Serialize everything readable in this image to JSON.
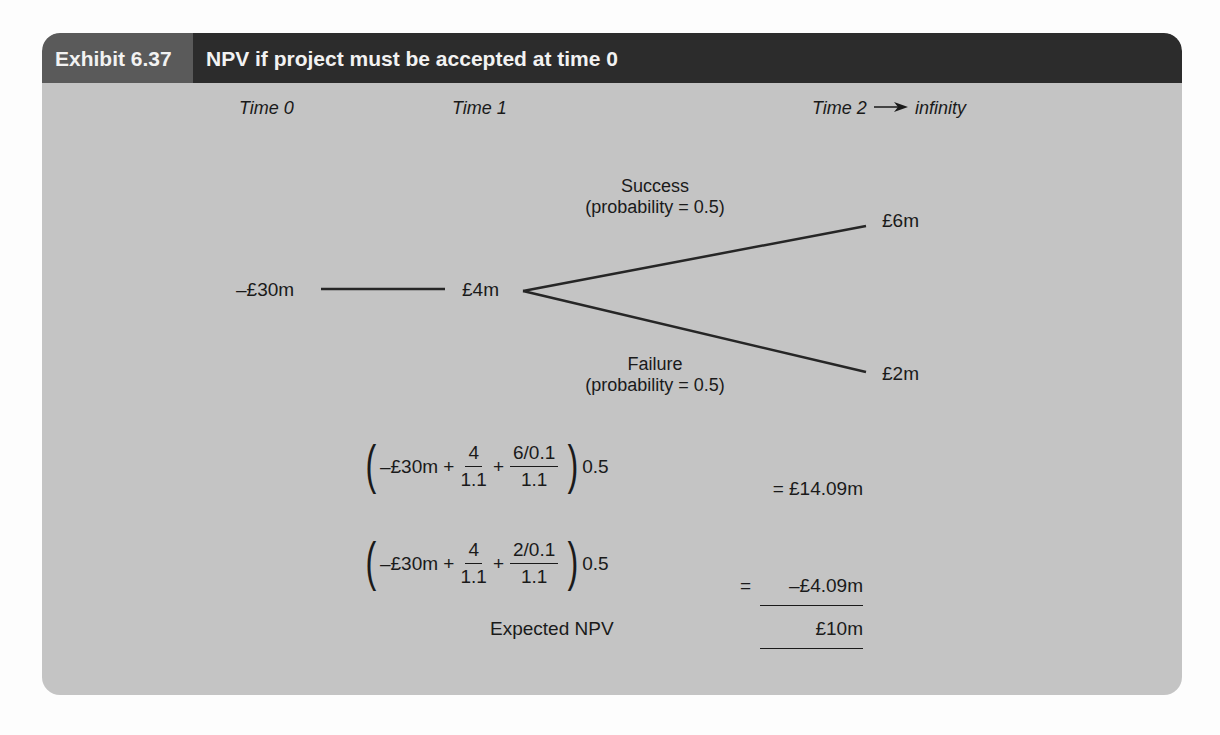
{
  "exhibit": {
    "number": "Exhibit 6.37",
    "title": "NPV if project must be accepted at time 0",
    "colors": {
      "box_bg": "#c4c4c4",
      "tab_num_bg": "#5a5a5a",
      "tab_title_bg": "#2c2c2c",
      "header_text": "#f2f2f2"
    }
  },
  "timeline": {
    "time0": "Time 0",
    "time1": "Time 1",
    "time2": "Time 2",
    "arrow": "→",
    "infinity": "infinity"
  },
  "tree": {
    "root_value": "–£30m",
    "node1_value": "£4m",
    "success": {
      "label": "Success",
      "prob": "(probability = 0.5)",
      "value": "£6m"
    },
    "failure": {
      "label": "Failure",
      "prob": "(probability = 0.5)",
      "value": "£2m"
    }
  },
  "calculations": [
    {
      "lead": "–£30m +",
      "f1_num": "4",
      "f1_den": "1.1",
      "plus": "+",
      "f2_num": "6/0.1",
      "f2_den": "1.1",
      "mult": "0.5",
      "result": "= £14.09m"
    },
    {
      "lead": "–£30m +",
      "f1_num": "4",
      "f1_den": "1.1",
      "plus": "+",
      "f2_num": "2/0.1",
      "f2_den": "1.1",
      "mult": "0.5",
      "result_eq": "=",
      "result": "–£4.09m"
    }
  ],
  "expected": {
    "label": "Expected NPV",
    "value": "£10m"
  }
}
